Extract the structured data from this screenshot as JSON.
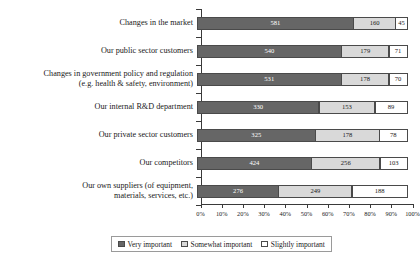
{
  "chart_data": {
    "type": "bar",
    "title": "",
    "subtitle": "",
    "xlabel": "",
    "ylabel": "",
    "orientation": "horizontal",
    "stacked": true,
    "normalized": true,
    "grid": false,
    "legend_position": "bottom",
    "xlim": [
      0,
      100
    ],
    "x_tick_labels": [
      "0%",
      "10%",
      "20%",
      "30%",
      "40%",
      "50%",
      "60%",
      "70%",
      "80%",
      "90%",
      "100%"
    ],
    "x_tick_values": [
      0,
      10,
      20,
      30,
      40,
      50,
      60,
      70,
      80,
      90,
      100
    ],
    "categories": [
      "Changes in the market",
      "Our public sector customers",
      "Changes in government policy and regulation\n(e.g. health & safety, environment)",
      "Our internal R&D department",
      "Our private sector customers",
      "Our competitors",
      "Our own suppliers (of equipment,\nmaterials, services, etc.)"
    ],
    "series": [
      {
        "name": "Very important",
        "color": "#666666",
        "values": [
          581,
          540,
          531,
          330,
          325,
          424,
          276
        ]
      },
      {
        "name": "Somewhat important",
        "color": "#d9d9d9",
        "values": [
          160,
          179,
          178,
          153,
          178,
          256,
          249
        ]
      },
      {
        "name": "Slightly important",
        "color": "#ffffff",
        "values": [
          45,
          71,
          70,
          89,
          78,
          103,
          188
        ]
      }
    ]
  }
}
